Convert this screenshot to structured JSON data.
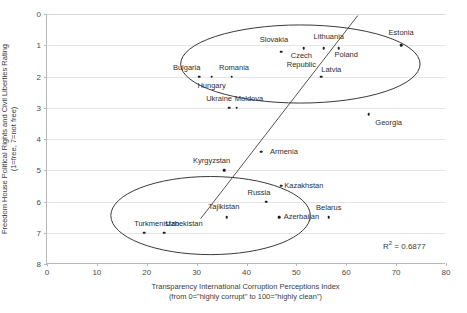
{
  "chart_data": {
    "type": "scatter",
    "title": "",
    "xlabel": "Transparency International Corruption Perceptions Index (from 0=\"highly corrupt\" to 100=\"highly clean\")",
    "xlabel_line1": "Transparency International Corruption Perceptions Index",
    "xlabel_line2": "(from 0=\"highly corrupt\" to 100=\"highly clean\")",
    "ylabel": "Freedom House Political Rights and Civil Liberties Rating (1=free, 7=not free)",
    "ylabel_line1": "Freedom House Political Rights and Civil Liberties Rating",
    "ylabel_line2": "(1=free, 7=not free)",
    "xlim": [
      0,
      80
    ],
    "ylim": [
      0,
      8
    ],
    "y_inverted": true,
    "xticks": [
      0,
      10,
      20,
      30,
      40,
      50,
      60,
      70,
      80
    ],
    "yticks": [
      0,
      1,
      2,
      3,
      4,
      5,
      6,
      7,
      8
    ],
    "grid": "horizontal",
    "legend": "none",
    "r_squared_label": "R² = 0.6877",
    "r_squared_value": 0.6877,
    "points": [
      {
        "name": "Estonia",
        "x": 71.0,
        "y": 1.0,
        "lx": 71.0,
        "ly": 0.62
      },
      {
        "name": "Slovakia",
        "x": 47.0,
        "y": 1.2,
        "lx": 45.5,
        "ly": 0.82
      },
      {
        "name": "Lithuania",
        "x": 55.5,
        "y": 1.1,
        "lx": 56.5,
        "ly": 0.72
      },
      {
        "name": "Poland",
        "x": 58.5,
        "y": 1.1,
        "lx": 60.0,
        "ly": 1.32
      },
      {
        "name": "Czech Republic",
        "x": 51.5,
        "y": 1.1,
        "lx": 51.0,
        "ly": 1.48,
        "label_text": "Czech\nRepublic"
      },
      {
        "name": "Latvia",
        "x": 55.0,
        "y": 2.0,
        "lx": 57.0,
        "ly": 1.78
      },
      {
        "name": "Romania",
        "x": 37.0,
        "y": 2.0,
        "lx": 37.5,
        "ly": 1.72
      },
      {
        "name": "Hungary",
        "x": 33.0,
        "y": 2.0,
        "lx": 33.0,
        "ly": 2.3
      },
      {
        "name": "Bulgaria",
        "x": 30.5,
        "y": 2.0,
        "lx": 28.0,
        "ly": 1.72
      },
      {
        "name": "Ukraine",
        "x": 36.5,
        "y": 3.0,
        "lx": 34.5,
        "ly": 2.72
      },
      {
        "name": "Moldova",
        "x": 38.0,
        "y": 3.0,
        "lx": 40.5,
        "ly": 2.72
      },
      {
        "name": "Georgia",
        "x": 64.5,
        "y": 3.2,
        "lx": 68.5,
        "ly": 3.5
      },
      {
        "name": "Armenia",
        "x": 43.0,
        "y": 4.4,
        "lx": 47.5,
        "ly": 4.42
      },
      {
        "name": "Kyrgyzstan",
        "x": 35.5,
        "y": 5.0,
        "lx": 33.0,
        "ly": 4.7
      },
      {
        "name": "Kazakhstan",
        "x": 47.0,
        "y": 5.5,
        "lx": 51.5,
        "ly": 5.5
      },
      {
        "name": "Russia",
        "x": 44.0,
        "y": 6.0,
        "lx": 42.5,
        "ly": 5.72
      },
      {
        "name": "Azerbaijan",
        "x": 46.5,
        "y": 6.5,
        "lx": 51.0,
        "ly": 6.5
      },
      {
        "name": "Belarus",
        "x": 56.5,
        "y": 6.5,
        "lx": 56.5,
        "ly": 6.2
      },
      {
        "name": "Tajikistan",
        "x": 36.0,
        "y": 6.5,
        "lx": 35.5,
        "ly": 6.18
      },
      {
        "name": "Turkmenistan",
        "x": 19.5,
        "y": 7.0,
        "lx": 22.0,
        "ly": 6.72
      },
      {
        "name": "Uzbekistan",
        "x": 23.5,
        "y": 7.0,
        "lx": 27.5,
        "ly": 6.72
      }
    ],
    "trendline": {
      "x0": 31.0,
      "y0": 6.55,
      "x1": 62.5,
      "y1": 0.05
    },
    "ellipses": [
      {
        "name": "democracies-cluster",
        "cx": 51.0,
        "cy": 1.6,
        "rx": 24.0,
        "ry": 1.25,
        "rotation": 0
      },
      {
        "name": "autocracies-cluster",
        "cx": 33.0,
        "cy": 6.45,
        "rx": 20.0,
        "ry": 1.25,
        "rotation": 0
      }
    ]
  }
}
